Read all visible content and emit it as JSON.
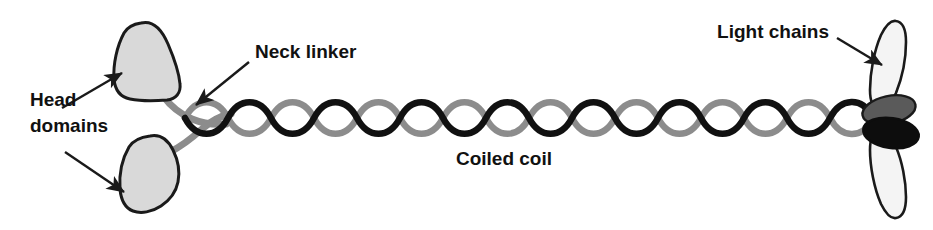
{
  "figure": {
    "background_color": "#ffffff",
    "width": 933,
    "height": 230
  },
  "labels": {
    "head_domains_line1": "Head",
    "head_domains_line2": "domains",
    "neck_linker": "Neck linker",
    "coiled_coil": "Coiled coil",
    "light_chains": "Light chains"
  },
  "colors": {
    "outline": "#1a1a1a",
    "head_domain_fill": "#d9d9d9",
    "light_chain_fill": "#f4f4f4",
    "light_chain_dark_gray_fill": "#5a5a5a",
    "light_chain_black_fill": "#0d0d0d",
    "coil_strand_dark": "#111111",
    "coil_strand_gray": "#8c8c8c",
    "neck_linker_stroke": "#8c8c8c",
    "arrow_stroke": "#1a1a1a",
    "text": "#111111"
  },
  "structure": {
    "head_domains": {
      "count": 2,
      "shape": "rounded-triangular-teardrop",
      "fill": "#d9d9d9",
      "positions": [
        "upper-left",
        "lower-left"
      ]
    },
    "neck_linkers": {
      "count": 2,
      "color": "#8c8c8c",
      "description": "gray curved connectors joining each head domain to the coiled coil"
    },
    "coiled_coil": {
      "strands": 2,
      "strand_colors": [
        "#111111",
        "#8c8c8c"
      ],
      "crossover_cycles": 8,
      "description": "two intertwined alpha-helical strands forming a supercoil"
    },
    "light_chains": {
      "pale_lobes": 2,
      "dark_gray_ovals": 1,
      "black_ovals": 1,
      "description": "tail-end lobes and ovals representing bound light chains"
    }
  },
  "annotations": [
    {
      "name": "head-domains-upper-arrow",
      "points_to": "upper head domain"
    },
    {
      "name": "head-domains-lower-arrow",
      "points_to": "lower head domain"
    },
    {
      "name": "neck-linker-arrow",
      "points_to": "neck linker junction"
    },
    {
      "name": "light-chains-arrow",
      "points_to": "upper pale light chain lobe"
    }
  ]
}
